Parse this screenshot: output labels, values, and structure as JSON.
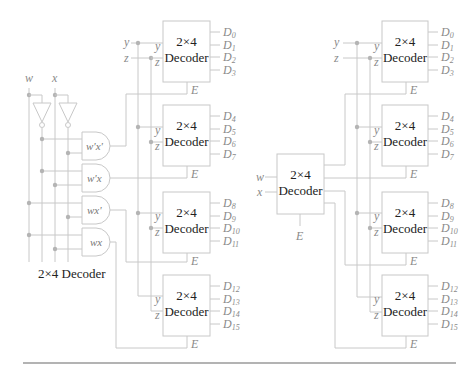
{
  "diagram": {
    "left": {
      "inputs": {
        "w": "w",
        "x": "x",
        "y": "y",
        "z": "z"
      },
      "caption": "2×4 Decoder",
      "gates": [
        {
          "label": "w'x'"
        },
        {
          "label": "w'x"
        },
        {
          "label": "wx'"
        },
        {
          "label": "wx"
        }
      ],
      "decoders": [
        {
          "title_line1": "2×4",
          "title_line2": "Decoder",
          "in_y": "y",
          "in_z": "z",
          "enable": "E",
          "outputs": [
            "D0",
            "D1",
            "D2",
            "D3"
          ]
        },
        {
          "title_line1": "2×4",
          "title_line2": "Decoder",
          "in_y": "y",
          "in_z": "z",
          "enable": "E",
          "outputs": [
            "D4",
            "D5",
            "D6",
            "D7"
          ]
        },
        {
          "title_line1": "2×4",
          "title_line2": "Decoder",
          "in_y": "y",
          "in_z": "z",
          "enable": "E",
          "outputs": [
            "D8",
            "D9",
            "D10",
            "D11"
          ]
        },
        {
          "title_line1": "2×4",
          "title_line2": "Decoder",
          "in_y": "y",
          "in_z": "z",
          "enable": "E",
          "outputs": [
            "D12",
            "D13",
            "D14",
            "D15"
          ]
        }
      ]
    },
    "right": {
      "inputs": {
        "w": "w",
        "x": "x",
        "y": "y",
        "z": "z"
      },
      "center_decoder": {
        "title_line1": "2×4",
        "title_line2": "Decoder",
        "enable": "E"
      },
      "decoders": [
        {
          "title_line1": "2×4",
          "title_line2": "Decoder",
          "in_y": "y",
          "in_z": "z",
          "enable": "E",
          "outputs": [
            "D0",
            "D1",
            "D2",
            "D3"
          ]
        },
        {
          "title_line1": "2×4",
          "title_line2": "Decoder",
          "in_y": "y",
          "in_z": "z",
          "enable": "E",
          "outputs": [
            "D4",
            "D5",
            "D6",
            "D7"
          ]
        },
        {
          "title_line1": "2×4",
          "title_line2": "Decoder",
          "in_y": "y",
          "in_z": "z",
          "enable": "E",
          "outputs": [
            "D8",
            "D9",
            "D10",
            "D11"
          ]
        },
        {
          "title_line1": "2×4",
          "title_line2": "Decoder",
          "in_y": "y",
          "in_z": "z",
          "enable": "E",
          "outputs": [
            "D12",
            "D13",
            "D14",
            "D15"
          ]
        }
      ]
    }
  }
}
